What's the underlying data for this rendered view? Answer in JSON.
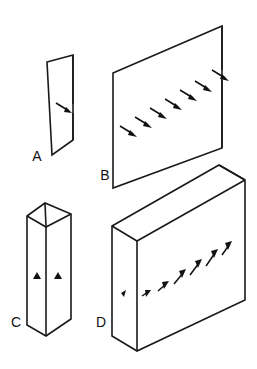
{
  "figure": {
    "background_color": "#ffffff",
    "line_color": "#1a1a1a",
    "arrow_color": "#111111",
    "width": 257,
    "height": 369
  },
  "panels": [
    {
      "id": "A",
      "label": "A",
      "shape_name": "narrow-thin-plate",
      "description": "Tall narrow thin plate shown in isometric projection, viewed nearly edge-on",
      "arrow_count": 1,
      "arrow_direction": "down-right",
      "label_position": {
        "x": 37,
        "y": 157
      }
    },
    {
      "id": "B",
      "label": "B",
      "shape_name": "wide-thin-plate",
      "description": "Wide thin plate shown in isometric projection with a diagonal row of arrows across the face",
      "arrow_count": 7,
      "arrow_direction": "down-right",
      "label_position": {
        "x": 105,
        "y": 176
      }
    },
    {
      "id": "C",
      "label": "C",
      "shape_name": "narrow-hollow-column",
      "description": "Tall narrow hollow rectangular column with open top, two small arrowheads on the front faces",
      "arrow_count": 2,
      "arrow_direction": "up",
      "label_position": {
        "x": 16,
        "y": 323
      }
    },
    {
      "id": "D",
      "label": "D",
      "shape_name": "wide-hollow-slab",
      "description": "Wide hollow rectangular slab box with open top and a diagonal row of arrows across the front face",
      "arrow_count": 7,
      "arrow_direction": "up-right",
      "label_position": {
        "x": 101,
        "y": 323
      }
    }
  ]
}
